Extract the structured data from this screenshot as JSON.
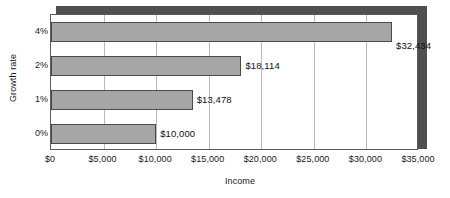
{
  "chart_data": {
    "type": "bar",
    "orientation": "horizontal",
    "title": "",
    "xlabel": "Income",
    "ylabel": "Growth rate",
    "categories": [
      "0%",
      "1%",
      "2%",
      "4%"
    ],
    "values": [
      10000,
      13478,
      18114,
      32434
    ],
    "data_labels": [
      "$10,000",
      "$13,478",
      "$18,114",
      "$32,434"
    ],
    "xlim": [
      0,
      35000
    ],
    "xticks": [
      0,
      5000,
      10000,
      15000,
      20000,
      25000,
      30000,
      35000
    ],
    "xtick_labels": [
      "$0",
      "$5,000",
      "$10,000",
      "$15,000",
      "$20,000",
      "$25,000",
      "$30,000",
      "$35,000"
    ],
    "grid": "vertical",
    "legend": "none",
    "colors": {
      "bar_fill": "#a6a6a6",
      "bar_edge": "#4a4a4a",
      "gridline": "#b9b9b9",
      "plot_border": "#5a5a5a",
      "shadow": "#4f4f4f",
      "background": "#ffffff",
      "text": "#1a1a1a"
    }
  },
  "axes": {
    "y_title": "Growth rate",
    "x_title": "Income"
  }
}
